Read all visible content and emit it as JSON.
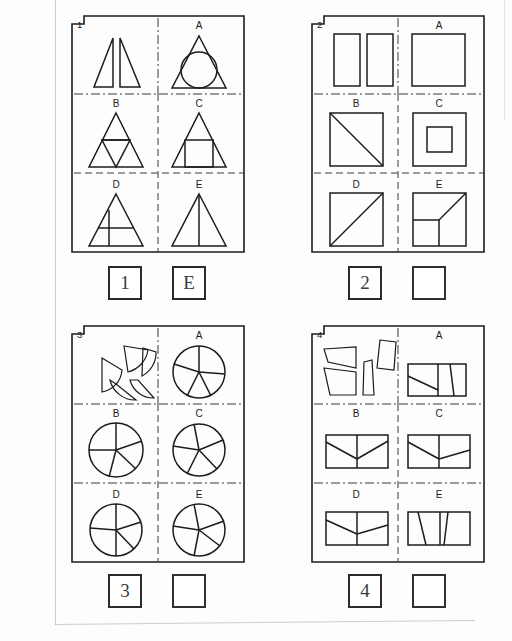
{
  "sheet": {
    "title": "Spatial reasoning worksheet",
    "panel_count": 4
  },
  "panels": [
    {
      "number": "1",
      "option_labels": [
        "A",
        "B",
        "C",
        "D",
        "E"
      ],
      "prompt_description": "two mirrored right triangles",
      "answer_number_label": "1",
      "answer_value": "E"
    },
    {
      "number": "2",
      "option_labels": [
        "A",
        "B",
        "C",
        "D",
        "E"
      ],
      "prompt_description": "two identical vertical rectangles",
      "answer_number_label": "2",
      "answer_value": ""
    },
    {
      "number": "3",
      "option_labels": [
        "A",
        "B",
        "C",
        "D",
        "E"
      ],
      "prompt_description": "five circular sector pieces",
      "answer_number_label": "3",
      "answer_value": ""
    },
    {
      "number": "4",
      "option_labels": [
        "A",
        "B",
        "C",
        "D",
        "E"
      ],
      "prompt_description": "four quadrilateral strip pieces",
      "answer_number_label": "4",
      "answer_value": ""
    }
  ],
  "colors": {
    "ink": "#1c1c1c",
    "divider": "#3a3a3a",
    "paper": "#fdfdfd",
    "margin": "#b9b9b9"
  }
}
